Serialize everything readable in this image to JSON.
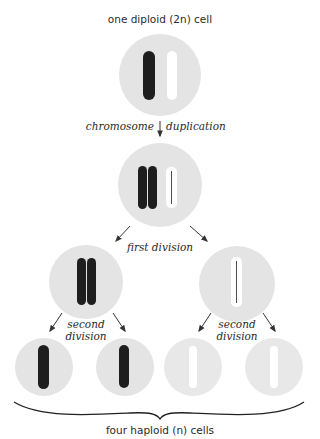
{
  "title": "one diploid (2n) cell",
  "footer": "four haploid (n) cells",
  "steps": {
    "duplication_left": "chromosome",
    "duplication_right": "duplication",
    "first_division": "first division",
    "second_division_line1": "second",
    "second_division_line2": "division"
  },
  "colors": {
    "cell_fill": "#e4e4e4",
    "dark_chromosome": "#1e1e1e",
    "light_chromosome": "#ffffff",
    "arrow": "#333333",
    "text": "#2a2a2a"
  },
  "cells": [
    {
      "id": "diploid",
      "chromosomes": [
        "dark",
        "light"
      ]
    },
    {
      "id": "duplicated",
      "chromosomes": [
        "dark-doubled",
        "light-doubled"
      ]
    },
    {
      "id": "first-left",
      "chromosomes": [
        "dark-doubled"
      ]
    },
    {
      "id": "first-right",
      "chromosomes": [
        "light-doubled"
      ]
    },
    {
      "id": "haploid-1",
      "chromosomes": [
        "dark"
      ]
    },
    {
      "id": "haploid-2",
      "chromosomes": [
        "dark"
      ]
    },
    {
      "id": "haploid-3",
      "chromosomes": [
        "light"
      ]
    },
    {
      "id": "haploid-4",
      "chromosomes": [
        "light"
      ]
    }
  ]
}
